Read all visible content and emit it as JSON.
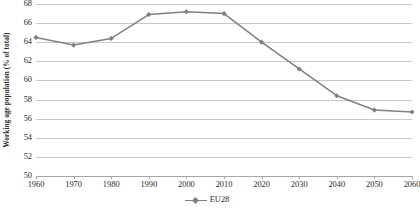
{
  "chart_data": {
    "type": "line",
    "title": "",
    "subtitle": "",
    "xlabel": "",
    "ylabel": "Working age population (% of total)",
    "x": [
      1960,
      1970,
      1980,
      1990,
      2000,
      2010,
      2020,
      2030,
      2040,
      2050,
      2060
    ],
    "categories": [
      "1960",
      "1970",
      "1980",
      "1990",
      "2000",
      "2010",
      "2020",
      "2030",
      "2040",
      "2050",
      "2060"
    ],
    "series": [
      {
        "name": "EU28",
        "color": "#808080",
        "marker": "diamond",
        "values": [
          64.5,
          63.7,
          64.4,
          66.9,
          67.2,
          67.0,
          64.0,
          61.2,
          58.4,
          56.9,
          56.7
        ]
      }
    ],
    "values": [
      64.5,
      63.7,
      64.4,
      66.9,
      67.2,
      67.0,
      64.0,
      61.2,
      58.4,
      56.9,
      56.7
    ],
    "ylim": [
      50,
      68
    ],
    "xlim": [
      1960,
      2060
    ],
    "yticks": [
      50,
      52,
      54,
      56,
      58,
      60,
      62,
      64,
      66,
      68
    ],
    "ytick_labels": [
      "50",
      "52",
      "54",
      "56",
      "58",
      "60",
      "62",
      "64",
      "66",
      "68"
    ],
    "xticks": [
      1960,
      1970,
      1980,
      1990,
      2000,
      2010,
      2020,
      2030,
      2040,
      2050,
      2060
    ],
    "xtick_labels": [
      "1960",
      "1970",
      "1980",
      "1990",
      "2000",
      "2010",
      "2020",
      "2030",
      "2040",
      "2050",
      "2060"
    ],
    "grid": true,
    "grid_axis": "y",
    "grid_color": "#c8c8c8",
    "legend": {
      "position": "bottom",
      "entries": [
        {
          "label": "EU28",
          "color": "#808080"
        }
      ]
    },
    "background": "#ffffff"
  }
}
